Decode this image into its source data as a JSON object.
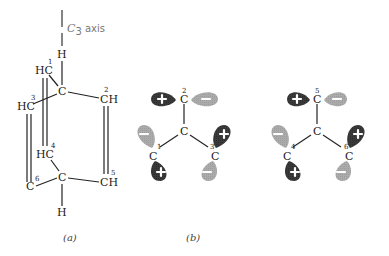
{
  "panel_a": {
    "caption": "(a)",
    "axis": {
      "label_c": "C",
      "label_sub": "3",
      "label_rest": " axis"
    },
    "atoms": {
      "top_h": "H",
      "top_c": "C",
      "c1": "HC",
      "c1_num": "1",
      "c2": "CH",
      "c2_num": "2",
      "c3": "HC",
      "c3_num": "3",
      "c4": "HC",
      "c4_num": "4",
      "c5": "CH",
      "c5_num": "5",
      "c6": "C",
      "c6_num": "6",
      "bottom_c": "C",
      "bottom_h": "H"
    }
  },
  "panel_b": {
    "caption": "(b)",
    "center": "C",
    "top": {
      "label": "C",
      "num": "2",
      "left_sign": "+",
      "right_sign": "−"
    },
    "left": {
      "label": "C",
      "num": "1",
      "upper_sign": "−",
      "lower_sign": "+"
    },
    "right": {
      "label": "C",
      "num": "3",
      "upper_sign": "+",
      "lower_sign": "−"
    }
  },
  "panel_c": {
    "center": "C",
    "top": {
      "label": "C",
      "num": "5",
      "left_sign": "+",
      "right_sign": "−"
    },
    "left": {
      "label": "C",
      "num": "4",
      "upper_sign": "−",
      "lower_sign": "+"
    },
    "right": {
      "label": "C",
      "num": "6",
      "upper_sign": "+",
      "lower_sign": "−"
    }
  },
  "colors": {
    "positive_lobe": "#3a3a3a",
    "negative_lobe": "#a9a9a9",
    "bond": "#222222"
  }
}
